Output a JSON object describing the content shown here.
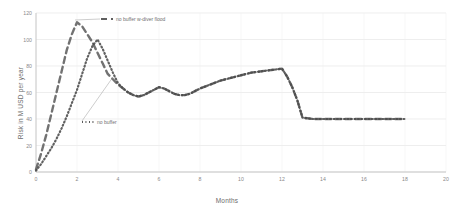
{
  "chart_data": {
    "type": "line",
    "title": "",
    "xlabel": "Months",
    "ylabel": "Risk in M USD per year",
    "xlim": [
      0,
      20
    ],
    "ylim": [
      0,
      120
    ],
    "xticks": [
      "0",
      "2",
      "4",
      "6",
      "8",
      "10",
      "12",
      "14",
      "16",
      "18",
      "20"
    ],
    "yticks": [
      "0",
      "20",
      "40",
      "60",
      "80",
      "100",
      "120"
    ],
    "grid": true,
    "legend_position": "inside-top",
    "series": [
      {
        "name": "no buffer w-diver flood",
        "style": "dashed",
        "color": "#5f5f5f",
        "x": [
          0,
          0.25,
          0.5,
          0.75,
          1.0,
          1.25,
          1.5,
          1.75,
          2.0,
          2.25,
          2.5,
          2.75,
          3.0,
          3.25,
          3.5,
          3.75,
          4.0,
          4.25,
          4.5,
          4.75,
          5.0,
          5.25,
          5.5,
          5.75,
          6.0,
          6.25,
          6.5,
          6.75,
          7.0,
          7.25,
          7.5,
          7.75,
          8.0,
          8.5,
          9.0,
          9.5,
          10.0,
          10.5,
          11.0,
          11.5,
          12.0,
          12.25,
          12.5,
          12.75,
          13.0,
          13.5,
          14.0,
          15.0,
          16.0,
          17.0,
          18.0
        ],
        "y": [
          2,
          14,
          28,
          44,
          60,
          76,
          92,
          104,
          113,
          110,
          104,
          98,
          90,
          82,
          74,
          70,
          66,
          63,
          60,
          58,
          57,
          58,
          60,
          62,
          64,
          63,
          61,
          59,
          58,
          58,
          59,
          61,
          63,
          66,
          69,
          71,
          73,
          75,
          76,
          77,
          78,
          72,
          64,
          54,
          41,
          40,
          40,
          40,
          40,
          40,
          40
        ]
      },
      {
        "name": "no buffer",
        "style": "dotted",
        "color": "#4a4a4a",
        "x": [
          0,
          0.25,
          0.5,
          0.75,
          1.0,
          1.25,
          1.5,
          1.75,
          2.0,
          2.25,
          2.5,
          2.75,
          3.0,
          3.25,
          3.5,
          3.75,
          4.0,
          4.25,
          4.5,
          4.75,
          5.0,
          5.25,
          5.5,
          5.75,
          6.0,
          6.25,
          6.5,
          6.75,
          7.0,
          7.25,
          7.5,
          7.75,
          8.0,
          8.5,
          9.0,
          9.5,
          10.0,
          10.5,
          11.0,
          11.5,
          12.0,
          12.25,
          12.5,
          12.75,
          13.0,
          13.5,
          14.0,
          15.0,
          16.0,
          17.0,
          18.0
        ],
        "y": [
          1,
          6,
          12,
          18,
          25,
          33,
          42,
          52,
          62,
          74,
          86,
          95,
          100,
          93,
          84,
          75,
          67,
          63,
          60,
          58,
          57,
          58,
          60,
          62,
          64,
          63,
          61,
          59,
          58,
          58,
          59,
          61,
          63,
          66,
          69,
          71,
          73,
          75,
          76,
          77,
          78,
          72,
          64,
          54,
          41,
          40,
          40,
          40,
          40,
          40,
          40
        ]
      }
    ],
    "legend": [
      {
        "label": "no buffer w-diver flood",
        "style": "dashed"
      },
      {
        "label": "no buffer",
        "style": "dotted"
      }
    ]
  }
}
